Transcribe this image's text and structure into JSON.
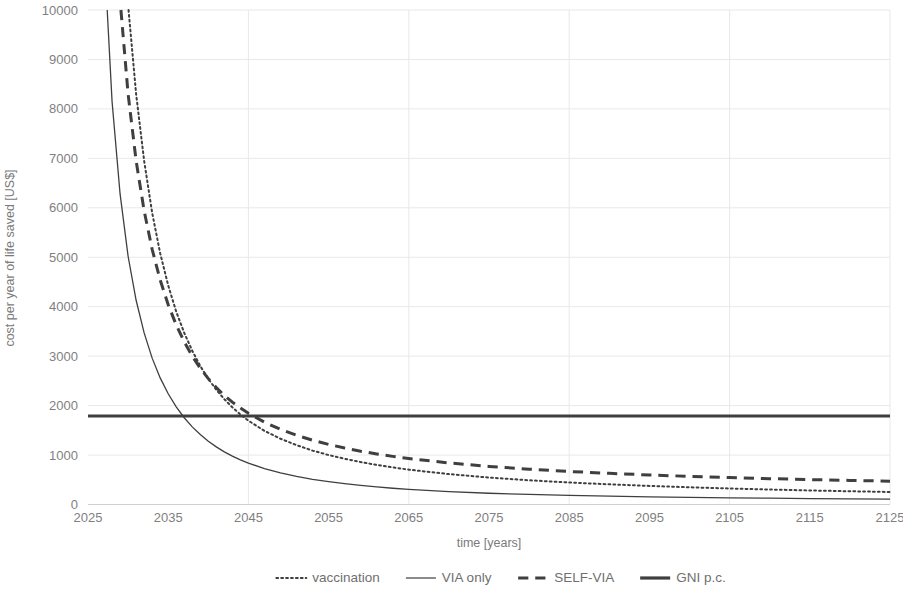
{
  "chart_data": {
    "type": "line",
    "title": "",
    "xlabel": "time [years]",
    "ylabel": "cost per year of life saved [US$]",
    "xlim": [
      2025,
      2125
    ],
    "ylim": [
      0,
      10000
    ],
    "grid": true,
    "legend_position": "bottom",
    "x_ticks": [
      2025,
      2035,
      2045,
      2055,
      2065,
      2075,
      2085,
      2095,
      2105,
      2115,
      2125
    ],
    "y_ticks": [
      0,
      1000,
      2000,
      3000,
      4000,
      5000,
      6000,
      7000,
      8000,
      9000,
      10000
    ],
    "x": [
      2025,
      2026,
      2027,
      2028,
      2029,
      2030,
      2031,
      2032,
      2033,
      2034,
      2035,
      2036,
      2037,
      2038,
      2039,
      2040,
      2041,
      2042,
      2043,
      2044,
      2045,
      2047,
      2049,
      2051,
      2053,
      2055,
      2057,
      2059,
      2061,
      2063,
      2065,
      2070,
      2075,
      2080,
      2085,
      2090,
      2095,
      2100,
      2105,
      2110,
      2115,
      2120,
      2125
    ],
    "series": [
      {
        "name": "vaccination",
        "style": "dotted",
        "color": "#3f3f3f",
        "width": 2.0,
        "values": [
          56000,
          33000,
          22000,
          16200,
          12600,
          10100,
          8300,
          6950,
          5900,
          5080,
          4430,
          3900,
          3470,
          3110,
          2800,
          2540,
          2320,
          2130,
          1965,
          1820,
          1695,
          1490,
          1330,
          1200,
          1090,
          1000,
          925,
          858,
          800,
          750,
          705,
          615,
          545,
          490,
          445,
          408,
          376,
          348,
          324,
          303,
          284,
          268,
          253
        ]
      },
      {
        "name": "VIA only",
        "style": "solid",
        "color": "#595959",
        "width": 1.3,
        "values": [
          30000,
          16800,
          11200,
          8150,
          6280,
          5020,
          4130,
          3470,
          2960,
          2560,
          2240,
          1975,
          1755,
          1570,
          1415,
          1280,
          1165,
          1065,
          978,
          903,
          836,
          726,
          638,
          567,
          509,
          461,
          420,
          385,
          355,
          329,
          306,
          261,
          228,
          203,
          183,
          168,
          155,
          144,
          135,
          127,
          120,
          114,
          109
        ]
      },
      {
        "name": "SELF-VIA",
        "style": "dashed",
        "color": "#3f3f3f",
        "width": 3.0,
        "values": [
          44000,
          26000,
          17500,
          13000,
          10200,
          8300,
          6950,
          5940,
          5160,
          4540,
          4040,
          3630,
          3290,
          3000,
          2755,
          2545,
          2365,
          2205,
          2070,
          1950,
          1845,
          1665,
          1520,
          1400,
          1300,
          1215,
          1142,
          1078,
          1022,
          973,
          930,
          840,
          770,
          714,
          668,
          630,
          597,
          569,
          545,
          523,
          504,
          487,
          472
        ]
      },
      {
        "name": "GNI p.c.",
        "style": "thick-solid",
        "color": "#3f3f3f",
        "width": 3.0,
        "constant": 1790,
        "values": [
          1790,
          1790,
          1790,
          1790,
          1790,
          1790,
          1790,
          1790,
          1790,
          1790,
          1790,
          1790,
          1790,
          1790,
          1790,
          1790,
          1790,
          1790,
          1790,
          1790,
          1790,
          1790,
          1790,
          1790,
          1790,
          1790,
          1790,
          1790,
          1790,
          1790,
          1790,
          1790,
          1790,
          1790,
          1790,
          1790,
          1790,
          1790,
          1790,
          1790,
          1790,
          1790,
          1790
        ]
      }
    ]
  },
  "legend": {
    "items": [
      {
        "label": "vaccination",
        "style": "dotted"
      },
      {
        "label": "VIA only",
        "style": "solid"
      },
      {
        "label": "SELF-VIA",
        "style": "dashed"
      },
      {
        "label": "GNI p.c.",
        "style": "thick-solid"
      }
    ]
  },
  "colors": {
    "series_dark": "#3f3f3f",
    "series_thin": "#595959",
    "grid": "#e8e8e8",
    "text": "#7f7f7f",
    "background": "#ffffff"
  }
}
